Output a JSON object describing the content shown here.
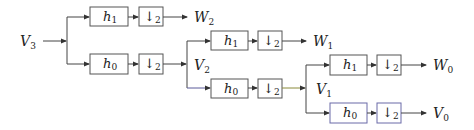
{
  "diagram": {
    "input": {
      "label": "V",
      "sub": "3"
    },
    "stages": [
      {
        "split_signal": {
          "label": "V",
          "sub": "3"
        },
        "high": {
          "filter": {
            "label": "h",
            "sub": "1"
          },
          "downsample": {
            "label": "↓",
            "sub": "2"
          },
          "output": {
            "label": "W",
            "sub": "2"
          }
        },
        "low": {
          "filter": {
            "label": "h",
            "sub": "0"
          },
          "downsample": {
            "label": "↓",
            "sub": "2"
          },
          "output": {
            "label": "V",
            "sub": "2"
          }
        }
      },
      {
        "split_signal": {
          "label": "V",
          "sub": "2"
        },
        "high": {
          "filter": {
            "label": "h",
            "sub": "1"
          },
          "downsample": {
            "label": "↓",
            "sub": "2"
          },
          "output": {
            "label": "W",
            "sub": "1"
          }
        },
        "low": {
          "filter": {
            "label": "h",
            "sub": "0"
          },
          "downsample": {
            "label": "↓",
            "sub": "2"
          },
          "output": {
            "label": "V",
            "sub": "1"
          }
        }
      },
      {
        "split_signal": {
          "label": "V",
          "sub": "1"
        },
        "high": {
          "filter": {
            "label": "h",
            "sub": "1"
          },
          "downsample": {
            "label": "↓",
            "sub": "2"
          },
          "output": {
            "label": "W",
            "sub": "0"
          }
        },
        "low": {
          "filter": {
            "label": "h",
            "sub": "0"
          },
          "downsample": {
            "label": "↓",
            "sub": "2"
          },
          "output": {
            "label": "V",
            "sub": "0"
          }
        }
      }
    ]
  }
}
